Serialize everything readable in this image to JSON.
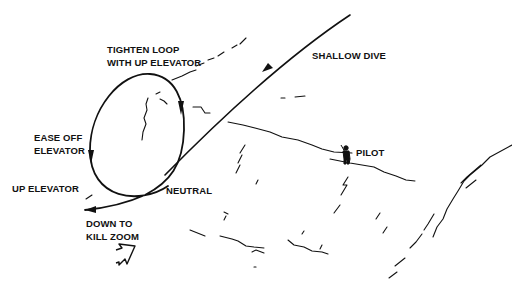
{
  "labels": {
    "tighten_loop_line1": "TIGHTEN LOOP",
    "tighten_loop_line2": "WITH UP ELEVATOR",
    "shallow_dive": "SHALLOW DIVE",
    "ease_off_line1": "EASE OFF",
    "ease_off_line2": "ELEVATOR",
    "up_elevator": "UP ELEVATOR",
    "neutral": "NEUTRAL",
    "down_to_line1": "DOWN TO",
    "down_to_line2": "KILL ZOOM",
    "pilot": "PILOT"
  },
  "colors": {
    "ink": "#111111",
    "background": "#ffffff"
  },
  "icons": {
    "pilot": "pilot-figure-icon",
    "wind": "wind-arrow-icon"
  }
}
